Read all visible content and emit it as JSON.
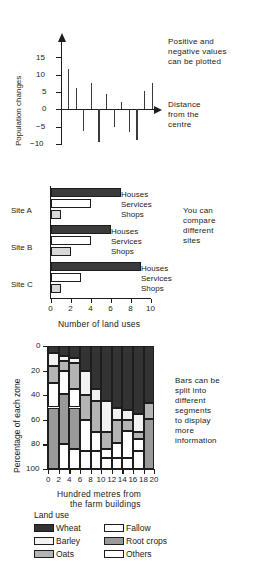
{
  "chart_data": [
    {
      "type": "bar",
      "title": "",
      "xlabel": "Distance from the centre",
      "ylabel": "Population changes",
      "ylim": [
        -10,
        17
      ],
      "yticks": [
        15,
        10,
        5,
        0,
        -5,
        -10
      ],
      "ytick_labels": [
        "15",
        "10",
        "5",
        "0",
        "−5",
        "−10"
      ],
      "annotation": "Positive and\nnegative values\ncan be plotted",
      "grid": false,
      "categories": [
        "1",
        "2",
        "3",
        "4",
        "5",
        "6",
        "7",
        "8",
        "9",
        "10",
        "11",
        "12"
      ],
      "values": [
        11.5,
        6,
        -6.2,
        7.6,
        -9.4,
        4.5,
        -5.2,
        2.1,
        -6.6,
        -8.8,
        5.3,
        7.7
      ]
    },
    {
      "type": "bar",
      "orientation": "horizontal",
      "title": "",
      "xlabel": "Number of land uses",
      "ylabel": "",
      "xlim": [
        0,
        10
      ],
      "xticks": [
        0,
        2,
        4,
        6,
        8,
        10
      ],
      "xtick_labels": [
        "0",
        "2",
        "4",
        "6",
        "8",
        "10"
      ],
      "annotation": "You can\ncompare\ndifferent\nsites",
      "series_names": [
        "Houses",
        "Services",
        "Shops"
      ],
      "groups": [
        {
          "label": "Site A",
          "values": [
            7,
            4,
            1
          ]
        },
        {
          "label": "Site B",
          "values": [
            6,
            4,
            2
          ]
        },
        {
          "label": "Site C",
          "values": [
            9,
            3,
            1
          ]
        }
      ]
    },
    {
      "type": "bar",
      "stacked": true,
      "title": "",
      "xlabel": "Hundred metres from\nthe farm buildings",
      "ylabel": "Percentage of each zone",
      "ylim": [
        0,
        100
      ],
      "y_inverted": true,
      "yticks": [
        0,
        20,
        40,
        60,
        80,
        100
      ],
      "ytick_labels": [
        "0",
        "20",
        "40",
        "60",
        "80",
        "100"
      ],
      "xticks": [
        0,
        2,
        4,
        6,
        8,
        10,
        12,
        14,
        16,
        18,
        20
      ],
      "xtick_labels": [
        "0",
        "2",
        "4",
        "6",
        "8",
        "10",
        "12",
        "14",
        "16",
        "18",
        "20"
      ],
      "annotation": "Bars can be\nsplit into\ndifferent\nsegments\nto display\nmore\ninformation",
      "legend_title": "Land use",
      "legend": [
        {
          "name": "Wheat",
          "color": "#333333"
        },
        {
          "name": "Fallow",
          "color": "#ffffff"
        },
        {
          "name": "Barley",
          "color": "#f2f2f2"
        },
        {
          "name": "Root crops",
          "color": "#9a9a9a"
        },
        {
          "name": "Oats",
          "color": "#b4b4b4"
        },
        {
          "name": "Others",
          "color": "#ffffff"
        }
      ],
      "categories": [
        "0-2",
        "2-4",
        "4-6",
        "6-8",
        "8-10",
        "10-12",
        "12-14",
        "14-16",
        "16-18",
        "18-20"
      ],
      "series": [
        {
          "name": "Wheat",
          "values": [
            6,
            8,
            10,
            20,
            35,
            45,
            50,
            52,
            55,
            46
          ]
        },
        {
          "name": "Barley",
          "values": [
            10,
            4,
            4,
            20,
            10,
            25,
            10,
            8,
            15,
            0
          ]
        },
        {
          "name": "Oats",
          "values": [
            14,
            8,
            21,
            20,
            25,
            14,
            19,
            9,
            6,
            13
          ]
        },
        {
          "name": "Fallow",
          "values": [
            20,
            19,
            15,
            25,
            15,
            7,
            12,
            22,
            9,
            0
          ]
        },
        {
          "name": "Root crops",
          "values": [
            50,
            41,
            34,
            0,
            0,
            0,
            0,
            0,
            0,
            41
          ]
        },
        {
          "name": "Others",
          "values": [
            0,
            20,
            16,
            15,
            15,
            9,
            9,
            9,
            15,
            0
          ]
        }
      ]
    }
  ],
  "chart1": {
    "ylabel": "Population changes",
    "annotation_line1": "Positive and",
    "annotation_line2": "negative values",
    "annotation_line3": "can be plotted",
    "xlabel_line1": "Distance",
    "xlabel_line2": "from the",
    "xlabel_line3": "centre",
    "ytick_labels": [
      "15",
      "10",
      "5",
      "0",
      "−5",
      "−10"
    ]
  },
  "chart2": {
    "xlabel": "Number of land uses",
    "annotation_line1": "You can",
    "annotation_line2": "compare",
    "annotation_line3": "different",
    "annotation_line4": "sites",
    "group_labels": [
      "Site A",
      "Site B",
      "Site C"
    ],
    "key_labels": [
      "Houses",
      "Services",
      "Shops"
    ],
    "xtick_labels": [
      "0",
      "2",
      "4",
      "6",
      "8",
      "10"
    ]
  },
  "chart3": {
    "ylabel": "Percentage of each zone",
    "xlabel_line1": "Hundred metres from",
    "xlabel_line2": "the farm buildings",
    "annotation_line1": "Bars can be",
    "annotation_line2": "split into",
    "annotation_line3": "different",
    "annotation_line4": "segments",
    "annotation_line5": "to display",
    "annotation_line6": "more",
    "annotation_line7": "information",
    "legend_title": "Land use",
    "legend_labels": [
      "Wheat",
      "Fallow",
      "Barley",
      "Root crops",
      "Oats",
      "Others"
    ],
    "ytick_labels": [
      "0",
      "20",
      "40",
      "60",
      "80",
      "100"
    ],
    "xtick_labels": [
      "0",
      "2",
      "4",
      "6",
      "8",
      "10",
      "12",
      "14",
      "16",
      "18",
      "20"
    ]
  }
}
